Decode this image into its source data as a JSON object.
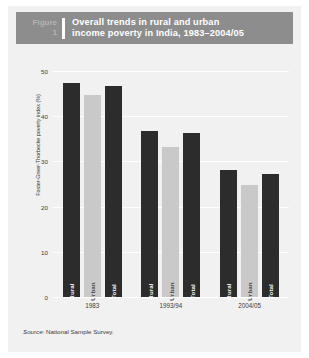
{
  "header": {
    "figure_word": "Figure",
    "figure_number": "1",
    "title_line_1": "Overall trends in rural and urban",
    "title_line_2": "income poverty in India, 1983–2004/05",
    "bg_color": "#8d8d8d",
    "title_color": "#ffffff",
    "figure_label_color": "#b4b4b4"
  },
  "source": {
    "label": "Source:",
    "text": "National Sample Survey."
  },
  "chart_data": {
    "type": "bar",
    "title": "Overall trends in rural and urban income poverty in India, 1983–2004/05",
    "xlabel": "",
    "ylabel": "Foster-Greer-Thorbecke poverty index (%)",
    "categories": [
      "1983",
      "1993/94",
      "2004/05"
    ],
    "series": [
      {
        "name": "Rural",
        "values": [
          47.5,
          37.0,
          28.3
        ],
        "color": "#2c2c2c"
      },
      {
        "name": "Urban",
        "values": [
          45.0,
          33.5,
          25.0
        ],
        "color": "#c9c9c9"
      },
      {
        "name": "Total",
        "values": [
          46.8,
          36.5,
          27.5
        ],
        "color": "#2c2c2c"
      }
    ],
    "ylim": [
      0,
      50
    ],
    "yticks": [
      0,
      10,
      20,
      30,
      40,
      50
    ],
    "ytick_labels": [
      "0",
      "10",
      "20",
      "30",
      "40",
      "50"
    ],
    "grid": true,
    "grid_color": "#ffffff",
    "legend": "none",
    "bar_labels_inside": true,
    "panel_bg": "#f1f1f1"
  }
}
